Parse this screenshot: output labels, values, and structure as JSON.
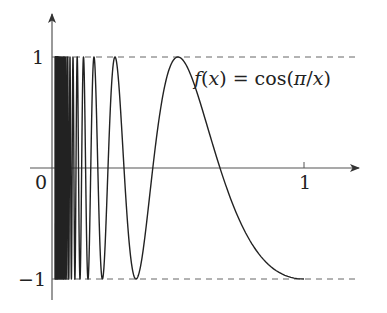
{
  "chart_data": {
    "type": "line",
    "title": "",
    "function_label": "f(x) = cos(π/x)",
    "formula_parts": {
      "f": "f",
      "open": "(",
      "x": "x",
      "close_eq": ") = cos(",
      "pi": "π",
      "slash": "/",
      "x2": "x",
      "close": ")"
    },
    "series": [
      {
        "name": "f(x) = cos(π/x)",
        "expression": "cos(pi/x)",
        "x_range": [
          0,
          1
        ],
        "color": "#222222"
      }
    ],
    "x_ticks": [
      {
        "value": 0,
        "label": "0"
      },
      {
        "value": 1,
        "label": "1"
      }
    ],
    "y_ticks": [
      {
        "value": 1,
        "label": "1"
      },
      {
        "value": -1,
        "label": "−1"
      }
    ],
    "reference_lines": [
      {
        "y": 1,
        "style": "dashed"
      },
      {
        "y": -1,
        "style": "dashed"
      }
    ],
    "xlim": [
      0,
      1.2
    ],
    "ylim": [
      -1.1,
      1.4
    ],
    "xlabel": "",
    "ylabel": "",
    "grid": false,
    "legend": "none"
  },
  "layout": {
    "origin_px": [
      52,
      168
    ],
    "x_unit_px": 252,
    "y_unit_px": 111
  }
}
